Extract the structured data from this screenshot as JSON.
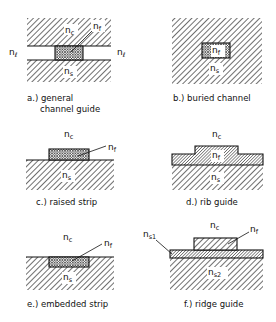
{
  "figure": {
    "legend_symbols": {
      "cover": {
        "base": "n",
        "sub": "c"
      },
      "film": {
        "base": "n",
        "sub": "f"
      },
      "substrate": {
        "base": "n",
        "sub": "s"
      },
      "lateral": {
        "base": "n",
        "sub": "ℓ"
      },
      "substrate1": {
        "base": "n",
        "sub": "s1"
      },
      "substrate2": {
        "base": "n",
        "sub": "s2"
      }
    },
    "panels": [
      {
        "id": "a",
        "caption_line1": "a.) general",
        "caption_line2": "channel guide",
        "labels": [
          "nc",
          "nf",
          "nℓ",
          "nℓ",
          "ns"
        ]
      },
      {
        "id": "b",
        "caption_line1": "b.) buried channel",
        "labels": [
          "nf",
          "ns"
        ]
      },
      {
        "id": "c",
        "caption_line1": "c.) raised strip",
        "labels": [
          "nc",
          "nf",
          "ns"
        ]
      },
      {
        "id": "d",
        "caption_line1": "d.) rib guide",
        "labels": [
          "nc",
          "nf",
          "ns"
        ]
      },
      {
        "id": "e",
        "caption_line1": "e.) embedded strip",
        "labels": [
          "nc",
          "nf",
          "ns"
        ]
      },
      {
        "id": "f",
        "caption_line1": "f.) ridge guide",
        "labels": [
          "nc",
          "nf",
          "ns1",
          "ns2"
        ]
      }
    ]
  },
  "colors": {
    "ink": "#111111",
    "background": "#ffffff"
  }
}
